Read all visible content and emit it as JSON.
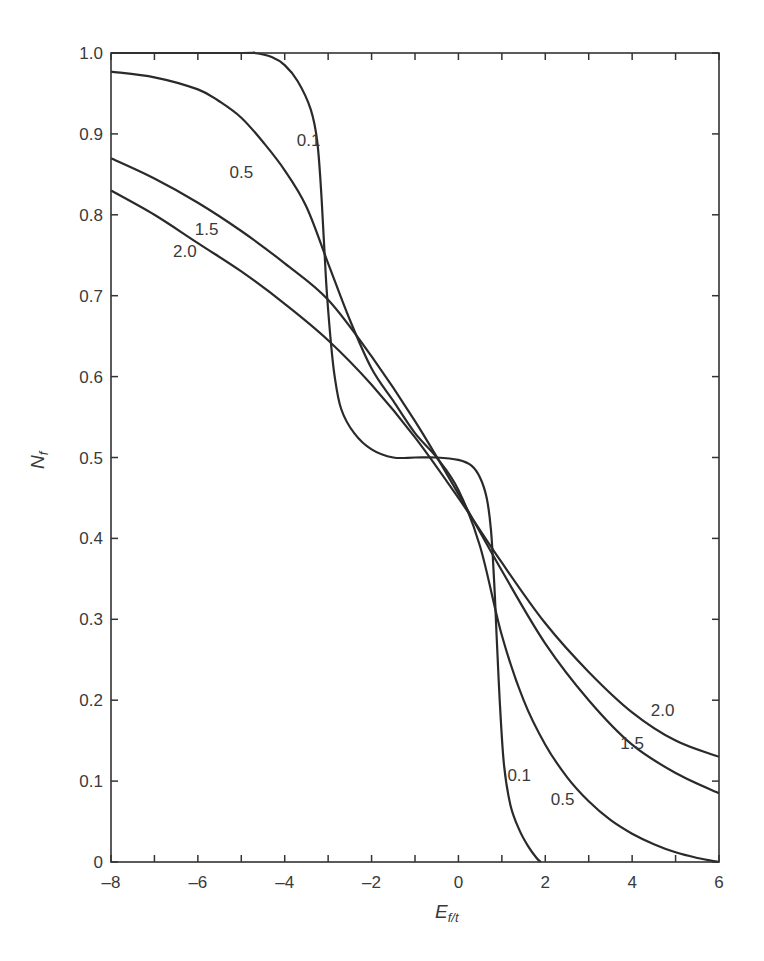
{
  "chart_data": {
    "type": "line",
    "title": "",
    "xlabel": "E_f/t",
    "ylabel": "N_f",
    "xlim": [
      -8,
      6
    ],
    "ylim": [
      0,
      1.0
    ],
    "grid": false,
    "legend": "inline curve labels",
    "x_ticks": [
      -8,
      -6,
      -4,
      -2,
      0,
      2,
      4,
      6
    ],
    "x_minor_ticks": [
      -7,
      -5,
      -3,
      -1,
      1,
      3,
      5
    ],
    "y_ticks": [
      0,
      0.1,
      0.2,
      0.3,
      0.4,
      0.5,
      0.6,
      0.7,
      0.8,
      0.9,
      1.0
    ],
    "y_tick_labels": [
      "0",
      "0.1",
      "0.2",
      "0.3",
      "0.4",
      "0.5",
      "0.6",
      "0.7",
      "0.8",
      "0.9",
      "1.0"
    ],
    "series": [
      {
        "name": "0.1",
        "x": [
          -8,
          -5,
          -4.7,
          -4.3,
          -4,
          -3.7,
          -3.4,
          -3.25,
          -3.15,
          -3.05,
          -2.95,
          -2.85,
          -2.7,
          -2.4,
          -2,
          -1.5,
          -1,
          -0.5,
          0,
          0.3,
          0.5,
          0.65,
          0.75,
          0.82,
          0.88,
          0.95,
          1.05,
          1.2,
          1.4,
          1.6,
          1.8,
          1.9
        ],
        "y": [
          1.0,
          1.0,
          1.0,
          0.995,
          0.985,
          0.965,
          0.93,
          0.89,
          0.82,
          0.72,
          0.65,
          0.6,
          0.56,
          0.53,
          0.51,
          0.5,
          0.5,
          0.5,
          0.497,
          0.49,
          0.475,
          0.45,
          0.41,
          0.35,
          0.28,
          0.2,
          0.12,
          0.07,
          0.04,
          0.02,
          0.005,
          0.0
        ],
        "labels": [
          {
            "text": "0.1",
            "x": -3.45,
            "y": 0.885
          },
          {
            "text": "0.1",
            "x": 1.4,
            "y": 0.1
          }
        ]
      },
      {
        "name": "0.5",
        "x": [
          -8,
          -7,
          -6,
          -5.5,
          -5,
          -4.5,
          -4,
          -3.5,
          -3,
          -2.5,
          -2,
          -1.5,
          -1,
          -0.5,
          0,
          0.5,
          1,
          1.5,
          2,
          2.5,
          3,
          3.5,
          4,
          4.5,
          5,
          5.5,
          6
        ],
        "y": [
          0.977,
          0.97,
          0.955,
          0.94,
          0.92,
          0.89,
          0.855,
          0.81,
          0.74,
          0.67,
          0.61,
          0.57,
          0.53,
          0.5,
          0.46,
          0.39,
          0.28,
          0.2,
          0.145,
          0.105,
          0.075,
          0.052,
          0.035,
          0.022,
          0.012,
          0.005,
          0.0
        ],
        "labels": [
          {
            "text": "0.5",
            "x": -5.0,
            "y": 0.845
          },
          {
            "text": "0.5",
            "x": 2.4,
            "y": 0.07
          }
        ]
      },
      {
        "name": "1.5",
        "x": [
          -8,
          -7,
          -6,
          -5,
          -4,
          -3,
          -2,
          -1,
          0,
          1,
          2,
          3,
          4,
          5,
          6
        ],
        "y": [
          0.87,
          0.845,
          0.815,
          0.78,
          0.74,
          0.695,
          0.625,
          0.545,
          0.455,
          0.36,
          0.27,
          0.2,
          0.145,
          0.11,
          0.085
        ],
        "labels": [
          {
            "text": "1.5",
            "x": -5.8,
            "y": 0.775
          },
          {
            "text": "1.5",
            "x": 4.0,
            "y": 0.14
          }
        ]
      },
      {
        "name": "2.0",
        "x": [
          -8,
          -7,
          -6,
          -5,
          -4,
          -3,
          -2,
          -1,
          0,
          1,
          2,
          3,
          4,
          5,
          6
        ],
        "y": [
          0.83,
          0.8,
          0.765,
          0.73,
          0.69,
          0.645,
          0.59,
          0.525,
          0.45,
          0.37,
          0.295,
          0.235,
          0.185,
          0.15,
          0.13
        ],
        "labels": [
          {
            "text": "2.0",
            "x": -6.3,
            "y": 0.748
          },
          {
            "text": "2.0",
            "x": 4.7,
            "y": 0.18
          }
        ]
      }
    ]
  },
  "axes": {
    "y_label_main": "N",
    "y_label_sub": "f",
    "x_label_main": "E",
    "x_label_sub": "f/t"
  }
}
